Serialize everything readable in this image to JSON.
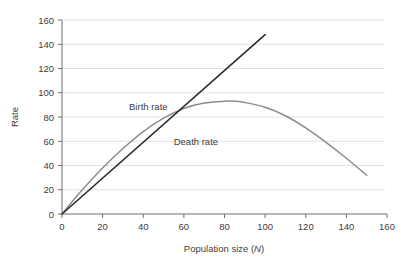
{
  "chart_data": {
    "type": "line",
    "title": "",
    "xlabel": "Population size (N)",
    "xlabel_plain": "Population size (",
    "xlabel_italic": "N",
    "xlabel_close": ")",
    "ylabel": "Rate",
    "xlim": [
      0,
      160
    ],
    "ylim": [
      0,
      160
    ],
    "xticks": [
      0,
      20,
      40,
      60,
      80,
      100,
      120,
      140,
      160
    ],
    "yticks": [
      0,
      20,
      40,
      60,
      80,
      100,
      120,
      140,
      160
    ],
    "grid": "horizontal",
    "legend": "inline-annotations",
    "series": [
      {
        "name": "Birth rate",
        "color": "#8c8c8c",
        "style": "curve-parabolic",
        "label_x": 33,
        "label_y": 86,
        "x": [
          0,
          10,
          20,
          30,
          40,
          50,
          60,
          70,
          80,
          85,
          90,
          100,
          110,
          120,
          130,
          140,
          150
        ],
        "values": [
          0,
          20,
          38,
          54,
          68,
          79,
          87,
          91.5,
          93,
          93,
          92,
          88,
          81,
          71,
          59,
          46,
          32
        ]
      },
      {
        "name": "Death rate",
        "color": "#2b2b2b",
        "style": "line-straight",
        "label_x": 55,
        "label_y": 57,
        "x": [
          0,
          100
        ],
        "values": [
          0,
          148
        ]
      }
    ],
    "annotations": [
      {
        "text": "Birth rate",
        "x": 33,
        "y": 86
      },
      {
        "text": "Death rate",
        "x": 55,
        "y": 57
      }
    ],
    "intersection": {
      "x": 68,
      "y": 89
    }
  },
  "colors": {
    "background": "#ffffff",
    "grid": "#d6d9e0",
    "axis": "#6e6e6e",
    "text": "#3d3d3d",
    "birth_rate": "#8c8c8c",
    "death_rate": "#2b2b2b"
  }
}
